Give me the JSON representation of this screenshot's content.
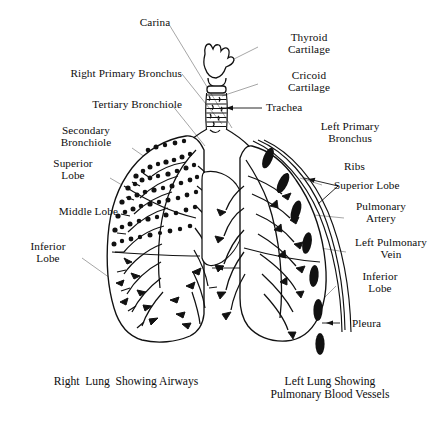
{
  "figure": {
    "background": "#ffffff",
    "ink": "#0d0d0d",
    "leader_color": "#8a8a8a"
  },
  "labels": {
    "carina": "Carina",
    "right_primary_bronchus": "Right Primary Bronchus",
    "tertiary_bronchiole": "Tertiary Bronchiole",
    "secondary_bronchiole": "Secondary\nBronchiole",
    "superior_lobe_left_col": "Superior\nLobe",
    "middle_lobe": "Middle Lobe",
    "inferior_lobe_left_col": "Inferior\nLobe",
    "thyroid_cartilage": "Thyroid\nCartilage",
    "cricoid_cartilage": "Cricoid\nCartilage",
    "trachea": "Trachea",
    "left_primary_bronchus": "Left Primary\nBronchus",
    "ribs": "Ribs",
    "superior_lobe_right_col": "Superior Lobe",
    "pulmonary_artery": "Pulmonary\nArtery",
    "left_pulmonary_vein": "Left Pulmonary\nVein",
    "inferior_lobe_right_col": "Inferior\nLobe",
    "pleura": "Pleura"
  },
  "captions": {
    "left": "Right  Lung  Showing Airways",
    "right": "Left Lung Showing\nPulmonary Blood Vessels"
  }
}
